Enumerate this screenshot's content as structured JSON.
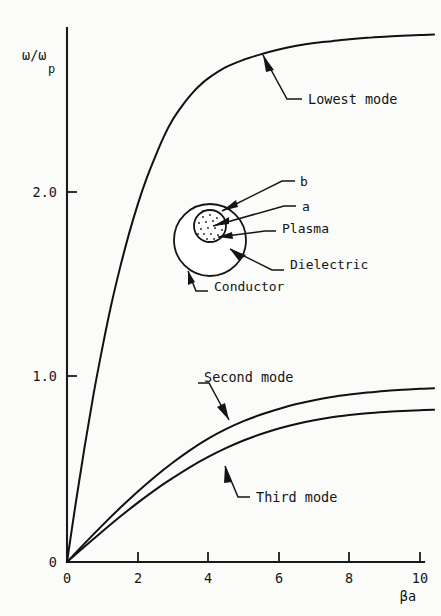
{
  "figure": {
    "background_color": "#fbfbfa",
    "ink_color": "#141414"
  },
  "axes": {
    "y_axis_label_main": "ω/ω",
    "y_axis_label_sub": "p",
    "x_axis_label": "βa",
    "y_ticks": [
      "2.0",
      "1.0",
      "0"
    ],
    "x_ticks": [
      "0",
      "2",
      "4",
      "6",
      "8",
      "10"
    ]
  },
  "annotations": {
    "lowest_mode": "Lowest mode",
    "second_mode": "Second mode",
    "third_mode": "Third mode"
  },
  "inset": {
    "label_b": "b",
    "label_a": "a",
    "label_plasma": "Plasma",
    "label_dielectric": "Dielectric",
    "label_conductor": "Conductor"
  },
  "chart_data": {
    "type": "line",
    "title": "",
    "xlabel": "βa",
    "ylabel": "ω/ω_p",
    "xlim": [
      0,
      10.6
    ],
    "ylim": [
      0,
      2.9
    ],
    "xticks": [
      0,
      2,
      4,
      6,
      8,
      10
    ],
    "yticks": [
      0,
      1.0,
      2.0
    ],
    "grid": false,
    "legend": "inline-annotations",
    "series": [
      {
        "name": "Lowest mode",
        "x": [
          0,
          0.25,
          0.5,
          0.75,
          1.0,
          1.25,
          1.5,
          1.75,
          2.0,
          2.25,
          2.5,
          2.75,
          3.0,
          3.25,
          3.5,
          3.75,
          4.0,
          4.5,
          5.0,
          5.5,
          6.0,
          6.5,
          7.0,
          7.5,
          8.0,
          8.5,
          9.0,
          9.5,
          10.0,
          10.4
        ],
        "y": [
          0,
          0.32,
          0.62,
          0.9,
          1.15,
          1.38,
          1.58,
          1.76,
          1.92,
          2.06,
          2.18,
          2.29,
          2.38,
          2.45,
          2.51,
          2.56,
          2.6,
          2.66,
          2.7,
          2.73,
          2.755,
          2.775,
          2.79,
          2.8,
          2.81,
          2.818,
          2.824,
          2.829,
          2.833,
          2.836
        ]
      },
      {
        "name": "Second mode",
        "x": [
          0,
          0.5,
          1.0,
          1.5,
          2.0,
          2.5,
          3.0,
          3.5,
          4.0,
          4.5,
          5.0,
          5.5,
          6.0,
          6.5,
          7.0,
          7.5,
          8.0,
          8.5,
          9.0,
          9.5,
          10.0,
          10.4
        ],
        "y": [
          0,
          0.1,
          0.197,
          0.29,
          0.378,
          0.46,
          0.535,
          0.603,
          0.663,
          0.714,
          0.757,
          0.793,
          0.823,
          0.849,
          0.87,
          0.887,
          0.9,
          0.911,
          0.92,
          0.926,
          0.931,
          0.934
        ]
      },
      {
        "name": "Third mode",
        "x": [
          0,
          0.5,
          1.0,
          1.5,
          2.0,
          2.5,
          3.0,
          3.5,
          4.0,
          4.5,
          5.0,
          5.5,
          6.0,
          6.5,
          7.0,
          7.5,
          8.0,
          8.5,
          9.0,
          9.5,
          10.0,
          10.4
        ],
        "y": [
          0,
          0.083,
          0.164,
          0.243,
          0.318,
          0.388,
          0.452,
          0.512,
          0.565,
          0.612,
          0.653,
          0.688,
          0.718,
          0.742,
          0.762,
          0.778,
          0.79,
          0.8,
          0.807,
          0.812,
          0.816,
          0.818
        ]
      }
    ]
  }
}
